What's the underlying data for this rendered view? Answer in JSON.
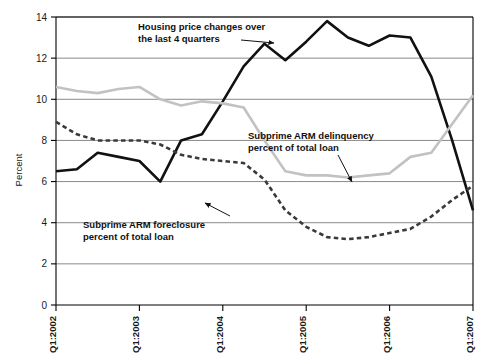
{
  "chart_data": {
    "type": "line",
    "title": "",
    "xlabel": "",
    "ylabel": "Percent",
    "ylim": [
      0,
      14
    ],
    "yticks": [
      0,
      2,
      4,
      6,
      8,
      10,
      12,
      14
    ],
    "ytick_labels": [
      "0",
      "2",
      "4",
      "6",
      "8",
      "10",
      "12",
      "14"
    ],
    "grid": true,
    "grid_axis": "y",
    "legend_position": "inline-annotations",
    "x": [
      "Q1:2002",
      "Q2:2002",
      "Q3:2002",
      "Q4:2002",
      "Q1:2003",
      "Q2:2003",
      "Q3:2003",
      "Q4:2003",
      "Q1:2004",
      "Q2:2004",
      "Q3:2004",
      "Q4:2004",
      "Q1:2005",
      "Q2:2005",
      "Q3:2005",
      "Q4:2005",
      "Q1:2006",
      "Q2:2006",
      "Q3:2006",
      "Q4:2006",
      "Q1:2007"
    ],
    "xtick_labels": [
      "Q1:2002",
      "Q1:2003",
      "Q1:2004",
      "Q1:2005",
      "Q1:2006",
      "Q1:2007"
    ],
    "xtick_indices": [
      0,
      4,
      8,
      12,
      16,
      20
    ],
    "series": [
      {
        "name": "Housing price changes over the last 4 quarters",
        "color": "#111111",
        "style": "solid",
        "width": 2.6,
        "values": [
          6.5,
          6.6,
          7.4,
          7.2,
          7.0,
          6.0,
          8.0,
          8.3,
          9.9,
          11.6,
          12.7,
          11.9,
          12.8,
          13.8,
          13.0,
          12.6,
          13.1,
          13.0,
          11.1,
          8.0,
          4.6
        ]
      },
      {
        "name": "Subprime ARM delinquency percent of total loan",
        "color": "#c2c2c2",
        "style": "solid",
        "width": 2.6,
        "values": [
          10.6,
          10.4,
          10.3,
          10.5,
          10.6,
          10.0,
          9.7,
          9.9,
          9.8,
          9.6,
          8.0,
          6.5,
          6.3,
          6.3,
          6.2,
          6.3,
          6.4,
          7.2,
          7.4,
          8.8,
          10.2
        ]
      },
      {
        "name": "Subprime ARM foreclosure percent of total loan",
        "color": "#3a3a3a",
        "style": "dashed",
        "width": 2.6,
        "values": [
          8.9,
          8.3,
          8.0,
          8.0,
          8.0,
          7.8,
          7.3,
          7.1,
          7.0,
          6.9,
          6.1,
          4.6,
          3.8,
          3.3,
          3.2,
          3.3,
          3.5,
          3.7,
          4.3,
          5.1,
          5.8
        ]
      }
    ],
    "annotations": [
      {
        "id": "housing-price-annotation",
        "line1": "Housing price changes over",
        "line2": "the last 4 quarters",
        "text_x": 138,
        "text_y": 30,
        "arrow": {
          "x1": 241,
          "y1": 40,
          "x2": 274,
          "y2": 43
        }
      },
      {
        "id": "delinquency-annotation",
        "line1": "Subprime ARM delinquency",
        "line2": "percent of total loan",
        "text_x": 248,
        "text_y": 139,
        "arrow": {
          "x1": 338,
          "y1": 155,
          "x2": 352,
          "y2": 182
        }
      },
      {
        "id": "foreclosure-annotation",
        "line1": "Subprime ARM foreclosure",
        "line2": "percent of total loan",
        "text_x": 83,
        "text_y": 228,
        "arrow": {
          "x1": 230,
          "y1": 216,
          "x2": 205,
          "y2": 203
        }
      }
    ],
    "colors": {
      "plot_border": "#000000",
      "gridline": "#8a8a8a",
      "background": "#ffffff",
      "text": "#1a1a1a"
    }
  },
  "axes": {
    "y_axis_title": "Percent"
  }
}
